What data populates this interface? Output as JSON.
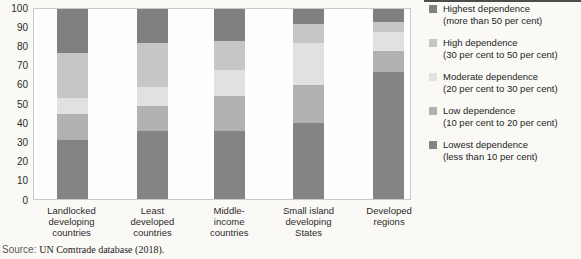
{
  "chart_data": {
    "type": "bar",
    "stacked": true,
    "grid": false,
    "legend_position": "right",
    "ylim": [
      0,
      100
    ],
    "y_ticks": [
      0,
      10,
      20,
      30,
      40,
      50,
      60,
      70,
      80,
      90,
      100
    ],
    "categories": [
      "Landlocked\ndeveloping\ncountries",
      "Least\ndeveloped\ncountries",
      "Middle-\nincome\ncountries",
      "Small island\ndeveloping\nStates",
      "Developed\nregions"
    ],
    "series": [
      {
        "name": "Lowest dependence (less than 10 per cent)",
        "color": "#848484",
        "values": [
          31,
          36,
          36,
          40,
          67
        ]
      },
      {
        "name": "Low dependence (10 per cent to 20 per cent)",
        "color": "#b1b1b1",
        "values": [
          14,
          13,
          18,
          20,
          11
        ]
      },
      {
        "name": "Moderate dependence (20 per cent to 30 per cent)",
        "color": "#e1e1e1",
        "values": [
          8,
          10,
          14,
          22,
          10
        ]
      },
      {
        "name": "High dependence (30 per cent to 50 per cent)",
        "color": "#c6c6c6",
        "values": [
          24,
          23,
          15,
          10,
          5
        ]
      },
      {
        "name": "Highest dependence (more than 50 per cent)",
        "color": "#808080",
        "values": [
          23,
          18,
          17,
          8,
          7
        ]
      }
    ],
    "legend": [
      {
        "name": "Highest dependence",
        "range": "(more than 50 per cent)",
        "color": "#808080"
      },
      {
        "name": "High dependence",
        "range": "(30 per cent to 50 per cent)",
        "color": "#c6c6c6"
      },
      {
        "name": "Moderate dependence",
        "range": "(20 per cent to 30 per cent)",
        "color": "#e1e1e1"
      },
      {
        "name": "Low dependence",
        "range": "(10 per cent to 20 per cent)",
        "color": "#b1b1b1"
      },
      {
        "name": "Lowest dependence",
        "range": "(less than 10 per cent)",
        "color": "#848484"
      }
    ]
  },
  "source_note": {
    "prefix": "Source:",
    "text": "UN Comtrade database (2018)."
  }
}
